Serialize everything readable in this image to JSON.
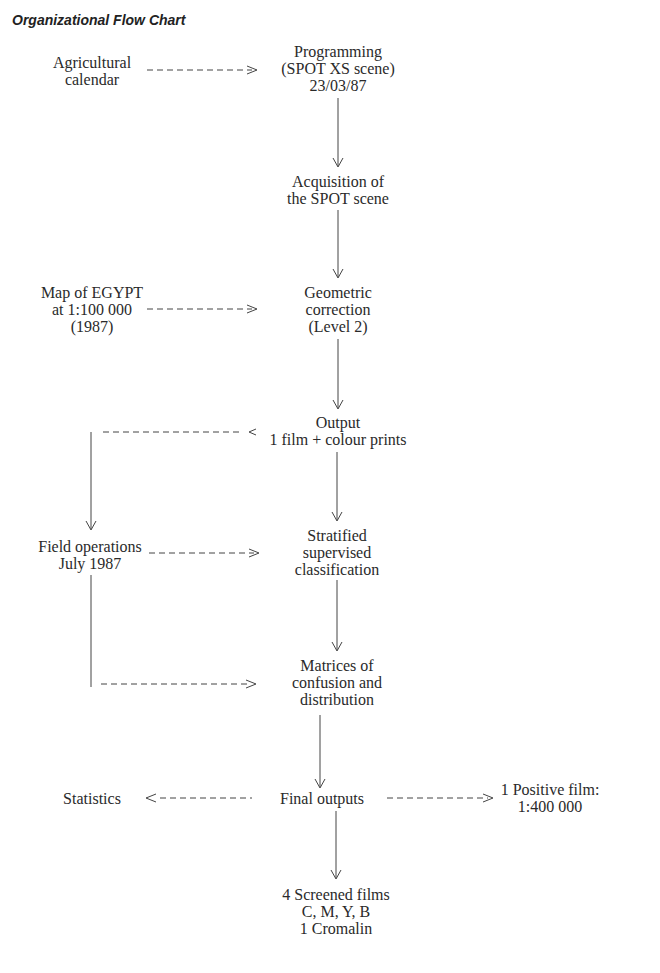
{
  "title": "Organizational Flow Chart",
  "nodes": {
    "agricultural_calendar": [
      "Agricultural",
      "calendar"
    ],
    "programming": [
      "Programming",
      "(SPOT XS scene)",
      "23/03/87"
    ],
    "acquisition": [
      "Acquisition of",
      "the SPOT scene"
    ],
    "map_egypt": [
      "Map of EGYPT",
      "at 1:100 000",
      "(1987)"
    ],
    "geometric": [
      "Geometric",
      "correction",
      "(Level 2)"
    ],
    "output": [
      "Output",
      "1 film + colour prints"
    ],
    "field_ops": [
      "Field operations",
      "July 1987"
    ],
    "stratified": [
      "Stratified",
      "supervised",
      "classification"
    ],
    "matrices": [
      "Matrices of",
      "confusion and",
      "distribution"
    ],
    "statistics": [
      "Statistics"
    ],
    "final_outputs": [
      "Final outputs"
    ],
    "positive_film": [
      "1 Positive film:",
      "1:400 000"
    ],
    "screened_films": [
      "4 Screened films",
      "C, M, Y, B",
      "1 Cromalin"
    ]
  },
  "edges": [
    {
      "from": "agricultural_calendar",
      "to": "programming",
      "style": "dashed"
    },
    {
      "from": "programming",
      "to": "acquisition",
      "style": "solid"
    },
    {
      "from": "acquisition",
      "to": "geometric",
      "style": "solid"
    },
    {
      "from": "map_egypt",
      "to": "geometric",
      "style": "dashed"
    },
    {
      "from": "geometric",
      "to": "output",
      "style": "solid"
    },
    {
      "from": "output",
      "to": "field_ops",
      "style": "dashed"
    },
    {
      "from": "output",
      "to": "stratified",
      "style": "solid"
    },
    {
      "from": "field_ops",
      "to": "stratified",
      "style": "dashed"
    },
    {
      "from": "field_ops",
      "to": "matrices",
      "style": "dashed"
    },
    {
      "from": "stratified",
      "to": "matrices",
      "style": "solid"
    },
    {
      "from": "matrices",
      "to": "final_outputs",
      "style": "solid"
    },
    {
      "from": "final_outputs",
      "to": "statistics",
      "style": "dashed"
    },
    {
      "from": "final_outputs",
      "to": "positive_film",
      "style": "dashed"
    },
    {
      "from": "final_outputs",
      "to": "screened_films",
      "style": "solid"
    }
  ]
}
